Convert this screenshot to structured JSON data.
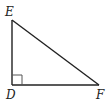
{
  "diagram": {
    "type": "right-triangle",
    "vertices": [
      {
        "label": "E",
        "x": 12,
        "y": 20,
        "label_x": 5,
        "label_y": 16
      },
      {
        "label": "D",
        "x": 12,
        "y": 85,
        "label_x": 6,
        "label_y": 99,
        "right_angle": true
      },
      {
        "label": "F",
        "x": 99,
        "y": 85,
        "label_x": 96,
        "label_y": 99
      }
    ],
    "right_angle_marker": {
      "size": 10
    },
    "colors": {
      "line": "#222222",
      "marker": "#555555",
      "background": "#ffffff"
    }
  }
}
